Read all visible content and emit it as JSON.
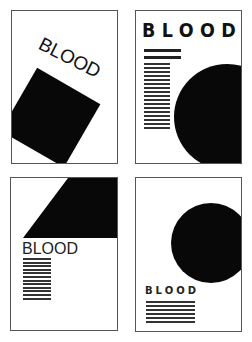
{
  "panels": [
    {
      "id": "p1",
      "title": "BLOOD",
      "title_style": "thin, rotated ~27deg",
      "shape": "rotated-square",
      "shape_color": "#080808"
    },
    {
      "id": "p2",
      "title": "BLOOD",
      "title_style": "bold, widely spaced",
      "rules": 2,
      "text_lines": 17,
      "shape": "circle",
      "shape_color": "#080808"
    },
    {
      "id": "p3",
      "title": "BLOOD",
      "title_style": "regular",
      "text_lines": 12,
      "shape": "trapezoid",
      "shape_color": "#080808"
    },
    {
      "id": "p4",
      "title": "BLOOD",
      "title_style": "bold, small, spaced",
      "text_lines": 6,
      "shape": "circle",
      "shape_color": "#080808"
    }
  ],
  "colors": {
    "background": "#ffffff",
    "ink": "#080808",
    "border": "#555555"
  }
}
